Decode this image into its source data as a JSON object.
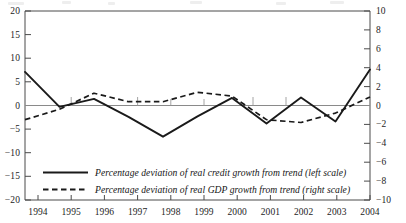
{
  "chart_data": {
    "type": "line",
    "title": "",
    "subtitle": "",
    "xlabel": "",
    "ylabel": "",
    "grid": false,
    "legend_position": "bottom-left-inside",
    "x": [
      1994,
      1995,
      1996,
      1997,
      1998,
      1999,
      2000,
      2001,
      2002,
      2003,
      2004
    ],
    "categories": [
      "1994",
      "1995",
      "1996",
      "1997",
      "1998",
      "1999",
      "2000",
      "2001",
      "2002",
      "2003",
      "2004"
    ],
    "axes": {
      "left": {
        "label": "",
        "ylim": [
          -20,
          20
        ],
        "tick_step": 5,
        "ticks": [
          20,
          15,
          10,
          5,
          0,
          -5,
          -10,
          -15,
          -20
        ],
        "tick_labels": [
          "20",
          "15",
          "10",
          "5",
          "0",
          "−5",
          "−10",
          "−15",
          "−20"
        ]
      },
      "right": {
        "label": "",
        "ylim": [
          -10,
          10
        ],
        "tick_step": 2,
        "ticks": [
          10,
          8,
          6,
          4,
          2,
          0,
          -2,
          -4,
          -6,
          -8,
          -10
        ],
        "tick_labels": [
          "10",
          "8",
          "6",
          "4",
          "2",
          "0",
          "−2",
          "−4",
          "−6",
          "−8",
          "−10"
        ]
      },
      "x": {
        "label": "",
        "xlim": [
          1994,
          2004
        ],
        "ticks": [
          1994,
          1995,
          1996,
          1997,
          1998,
          1999,
          2000,
          2001,
          2002,
          2003,
          2004
        ],
        "tick_labels": [
          "1994",
          "1995",
          "1996",
          "1997",
          "1998",
          "1999",
          "2000",
          "2001",
          "2002",
          "2003",
          "2004"
        ]
      }
    },
    "series": [
      {
        "name": "Percentage deviation of real credit growth from trend (left scale)",
        "axis": "left",
        "style": "solid",
        "color": "#1a1a1a",
        "values": [
          7.1,
          -0.3,
          1.4,
          -2.4,
          -6.6,
          -2.3,
          1.6,
          -3.8,
          1.7,
          -3.4,
          7.6
        ]
      },
      {
        "name": "Percentage deviation of real GDP growth from trend (right scale)",
        "axis": "right",
        "style": "dashed",
        "color": "#1a1a1a",
        "values": [
          -1.5,
          -0.4,
          1.3,
          0.4,
          0.4,
          1.4,
          1.0,
          -1.5,
          -1.8,
          -0.8,
          0.9
        ]
      }
    ]
  },
  "legend": {
    "items": [
      {
        "label": "Percentage deviation of real credit growth from trend (left scale)",
        "style": "solid"
      },
      {
        "label": "Percentage deviation of real GDP growth from trend (right scale)",
        "style": "dashed"
      }
    ]
  },
  "colors": {
    "line": "#1a1a1a",
    "axis": "#4b4b4b",
    "zero_line": "#7c7c7c",
    "text": "#1a1a1a",
    "background": "#ffffff"
  },
  "geometry": {
    "plot_left": 25,
    "plot_right": 370,
    "plot_top": 11,
    "plot_bottom": 200,
    "zero_y": 105.5
  }
}
